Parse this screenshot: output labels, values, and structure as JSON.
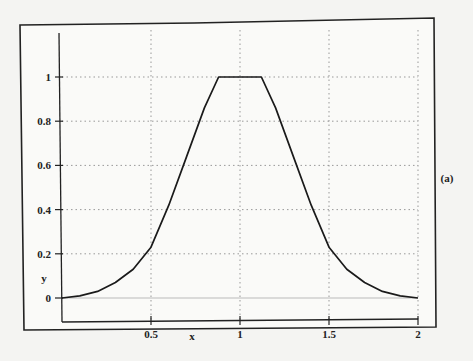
{
  "chart_data": {
    "type": "line",
    "title": "",
    "xlabel": "x",
    "ylabel": "y",
    "panel_label": "(a)",
    "xlim": [
      0,
      2
    ],
    "ylim": [
      -0.1,
      1.2
    ],
    "grid": true,
    "x_ticks": [
      "0.5",
      "1",
      "1.5",
      "2"
    ],
    "y_ticks": [
      "0",
      "0.2",
      "0.4",
      "0.6",
      "0.8",
      "1"
    ],
    "series": [
      {
        "name": "y",
        "x": [
          0,
          0.1,
          0.2,
          0.3,
          0.4,
          0.5,
          0.6,
          0.7,
          0.8,
          0.88,
          1.0,
          1.12,
          1.2,
          1.3,
          1.4,
          1.5,
          1.6,
          1.7,
          1.8,
          1.9,
          2.0
        ],
        "values": [
          0,
          0.01,
          0.03,
          0.07,
          0.13,
          0.23,
          0.42,
          0.64,
          0.86,
          1.0,
          1.0,
          1.0,
          0.86,
          0.64,
          0.42,
          0.23,
          0.13,
          0.07,
          0.03,
          0.01,
          0
        ]
      }
    ]
  }
}
